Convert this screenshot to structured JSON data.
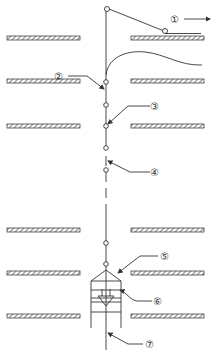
{
  "diagram": {
    "type": "mining/shaft schematic",
    "labels": [
      {
        "id": "1",
        "text": "①",
        "x": 170,
        "y": 19
      },
      {
        "id": "2",
        "text": "②",
        "x": 58,
        "y": 76
      },
      {
        "id": "3",
        "text": "③",
        "x": 158,
        "y": 106
      },
      {
        "id": "4",
        "text": "④",
        "x": 158,
        "y": 172
      },
      {
        "id": "5",
        "text": "⑤",
        "x": 166,
        "y": 256
      },
      {
        "id": "6",
        "text": "⑥",
        "x": 160,
        "y": 301
      },
      {
        "id": "7",
        "text": "⑦",
        "x": 150,
        "y": 344
      }
    ],
    "floor_rows_y": [
      38,
      81,
      125,
      244,
      273,
      316
    ],
    "arrow_direction_label_1": "right"
  }
}
